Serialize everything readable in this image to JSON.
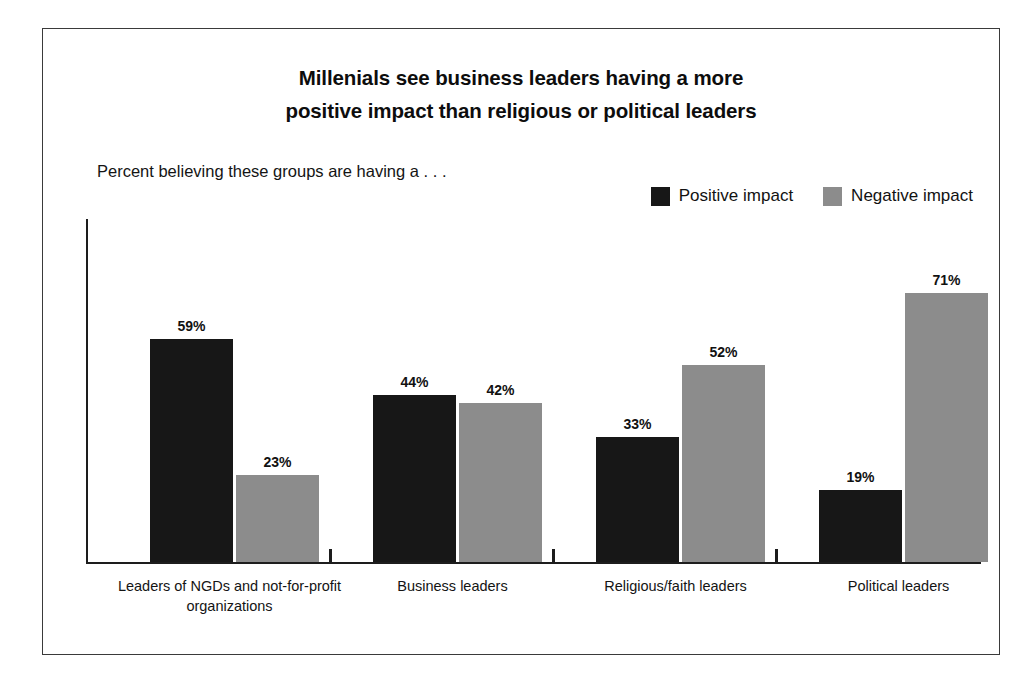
{
  "figure": {
    "title_lines": [
      "Millenials see business leaders having a more",
      "positive impact than religious or political leaders"
    ],
    "subtitle": "Percent believing these groups are having a . . ."
  },
  "legend": {
    "items": [
      {
        "label": "Positive impact",
        "color": "#171717",
        "swatch_name": "positive-impact-swatch"
      },
      {
        "label": "Negative impact",
        "color": "#8c8c8c",
        "swatch_name": "negative-impact-swatch"
      }
    ]
  },
  "chart_data": {
    "type": "bar",
    "title": "Millenials see business leaders having a more positive impact than religious or political leaders",
    "subtitle": "Percent believing these groups are having a . . .",
    "categories": [
      "Leaders of NGDs and not-for-profit organizations",
      "Business leaders",
      "Religious/faith leaders",
      "Political leaders"
    ],
    "category_lines": [
      [
        "Leaders of NGDs and not-for-profit",
        "organizations"
      ],
      [
        "Business leaders"
      ],
      [
        "Religious/faith leaders"
      ],
      [
        "Political leaders"
      ]
    ],
    "series": [
      {
        "name": "Positive impact",
        "color": "#171717",
        "values": [
          59,
          44,
          33,
          19
        ],
        "labels": [
          "59%",
          "44%",
          "33%",
          "19%"
        ]
      },
      {
        "name": "Negative impact",
        "color": "#8c8c8c",
        "values": [
          23,
          42,
          52,
          71
        ],
        "labels": [
          "23%",
          "42%",
          "52%",
          "71%"
        ]
      }
    ],
    "xlabel": "",
    "ylabel": "",
    "ylim": [
      0,
      80
    ],
    "grid": false,
    "y_axis_ticks_visible": false,
    "legend_position": "top-right",
    "value_label_suffix": "%"
  }
}
